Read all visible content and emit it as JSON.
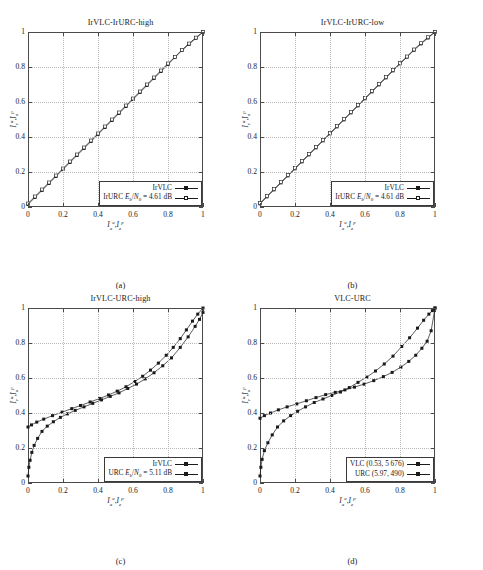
{
  "figure": {
    "axis_labels": {
      "x": "I_a^u , I_e^p",
      "y": "I_e^u , I_a^p"
    },
    "tick_labels": [
      "0",
      "0.2",
      "0.4",
      "0.6",
      "0.8",
      "1"
    ],
    "tick_values": [
      0,
      0.2,
      0.4,
      0.6,
      0.8,
      1
    ]
  },
  "panels": [
    {
      "id": "a",
      "caption": "(a)",
      "title": "IrVLC-IrURC-high",
      "legend": [
        {
          "label": "IrVLC",
          "marker": "filled-square"
        },
        {
          "label": "IrURC E_b/N_0 = 4.61 dB",
          "marker": "open-square"
        }
      ]
    },
    {
      "id": "b",
      "caption": "(b)",
      "title": "IrVLC-IrURC-low",
      "legend": [
        {
          "label": "IrVLC",
          "marker": "filled-square"
        },
        {
          "label": "IrURC E_b/N_0 = 4.61 dB",
          "marker": "open-square"
        }
      ]
    },
    {
      "id": "c",
      "caption": "(c)",
      "title": "IrVLC-URC-high",
      "legend": [
        {
          "label": "IrVLC",
          "marker": "filled-square"
        },
        {
          "label": "URC E_b/N_0 = 5.11 dB",
          "marker": "filled-square"
        }
      ]
    },
    {
      "id": "d",
      "caption": "(d)",
      "title": "VLC-URC",
      "legend": [
        {
          "label": "VLC (0.53, 5 676)",
          "marker": "filled-square"
        },
        {
          "label": "URC (5.97,   490)",
          "marker": "filled-square"
        }
      ]
    }
  ],
  "chart_data": [
    {
      "panel": "a",
      "type": "line",
      "title": "IrVLC-IrURC-high",
      "xlabel": "I_a^u , I_e^p",
      "ylabel": "I_e^u , I_a^p",
      "xlim": [
        0,
        1
      ],
      "ylim": [
        0,
        1
      ],
      "grid": true,
      "legend_position": "bottom-right",
      "series": [
        {
          "name": "IrVLC",
          "marker": "filled-square",
          "x": [
            0.0,
            0.04,
            0.08,
            0.12,
            0.16,
            0.2,
            0.24,
            0.28,
            0.32,
            0.36,
            0.4,
            0.44,
            0.48,
            0.52,
            0.56,
            0.6,
            0.64,
            0.68,
            0.72,
            0.76,
            0.8,
            0.84,
            0.88,
            0.92,
            0.96,
            1.0
          ],
          "y": [
            0.015,
            0.055,
            0.095,
            0.135,
            0.175,
            0.215,
            0.255,
            0.295,
            0.335,
            0.375,
            0.415,
            0.455,
            0.495,
            0.535,
            0.575,
            0.615,
            0.655,
            0.695,
            0.735,
            0.775,
            0.815,
            0.855,
            0.895,
            0.93,
            0.965,
            1.0
          ]
        },
        {
          "name": "IrURC Eb/N0 = 4.61 dB",
          "marker": "open-square",
          "x": [
            0.0,
            0.04,
            0.08,
            0.12,
            0.16,
            0.2,
            0.24,
            0.28,
            0.32,
            0.36,
            0.4,
            0.44,
            0.48,
            0.52,
            0.56,
            0.6,
            0.64,
            0.68,
            0.72,
            0.76,
            0.8,
            0.84,
            0.88,
            0.92,
            0.96,
            1.0
          ],
          "y": [
            0.02,
            0.06,
            0.1,
            0.14,
            0.18,
            0.22,
            0.26,
            0.3,
            0.34,
            0.38,
            0.42,
            0.46,
            0.5,
            0.54,
            0.58,
            0.62,
            0.66,
            0.7,
            0.74,
            0.78,
            0.82,
            0.858,
            0.898,
            0.934,
            0.968,
            1.0
          ]
        }
      ]
    },
    {
      "panel": "b",
      "type": "line",
      "title": "IrVLC-IrURC-low",
      "xlabel": "I_a^u , I_e^p",
      "ylabel": "I_e^u , I_a^p",
      "xlim": [
        0,
        1
      ],
      "ylim": [
        0,
        1
      ],
      "grid": true,
      "legend_position": "bottom-right",
      "series": [
        {
          "name": "IrVLC",
          "marker": "filled-square",
          "x": [
            0.0,
            0.04,
            0.08,
            0.12,
            0.16,
            0.2,
            0.24,
            0.28,
            0.32,
            0.36,
            0.4,
            0.44,
            0.48,
            0.52,
            0.56,
            0.6,
            0.64,
            0.68,
            0.72,
            0.76,
            0.8,
            0.84,
            0.88,
            0.92,
            0.96,
            1.0
          ],
          "y": [
            0.018,
            0.058,
            0.098,
            0.138,
            0.178,
            0.218,
            0.258,
            0.298,
            0.338,
            0.378,
            0.418,
            0.458,
            0.498,
            0.538,
            0.578,
            0.618,
            0.658,
            0.698,
            0.738,
            0.778,
            0.818,
            0.857,
            0.896,
            0.932,
            0.966,
            1.0
          ]
        },
        {
          "name": "IrURC Eb/N0 = 4.61 dB",
          "marker": "open-square",
          "x": [
            0.0,
            0.04,
            0.08,
            0.12,
            0.16,
            0.2,
            0.24,
            0.28,
            0.32,
            0.36,
            0.4,
            0.44,
            0.48,
            0.52,
            0.56,
            0.6,
            0.64,
            0.68,
            0.72,
            0.76,
            0.8,
            0.84,
            0.88,
            0.92,
            0.96,
            1.0
          ],
          "y": [
            0.022,
            0.062,
            0.102,
            0.142,
            0.182,
            0.222,
            0.262,
            0.302,
            0.342,
            0.382,
            0.422,
            0.462,
            0.502,
            0.542,
            0.582,
            0.622,
            0.662,
            0.702,
            0.742,
            0.782,
            0.822,
            0.86,
            0.9,
            0.936,
            0.97,
            1.0
          ]
        }
      ]
    },
    {
      "panel": "c",
      "type": "line",
      "title": "IrVLC-URC-high",
      "xlabel": "I_a^u , I_e^p",
      "ylabel": "I_e^u , I_a^p",
      "xlim": [
        0,
        1
      ],
      "ylim": [
        0,
        1
      ],
      "grid": true,
      "legend_position": "bottom-right",
      "series": [
        {
          "name": "IrVLC",
          "marker": "filled-square",
          "x": [
            0.0,
            0.005,
            0.012,
            0.022,
            0.035,
            0.055,
            0.08,
            0.11,
            0.145,
            0.185,
            0.225,
            0.27,
            0.32,
            0.37,
            0.42,
            0.47,
            0.52,
            0.57,
            0.62,
            0.67,
            0.72,
            0.77,
            0.82,
            0.87,
            0.915,
            0.955,
            0.98,
            1.0
          ],
          "y": [
            0.04,
            0.09,
            0.13,
            0.175,
            0.215,
            0.255,
            0.295,
            0.325,
            0.35,
            0.375,
            0.395,
            0.415,
            0.435,
            0.455,
            0.475,
            0.495,
            0.515,
            0.54,
            0.565,
            0.595,
            0.63,
            0.67,
            0.715,
            0.775,
            0.835,
            0.895,
            0.935,
            0.975
          ]
        },
        {
          "name": "URC Eb/N0 = 5.11 dB",
          "marker": "filled-square",
          "x": [
            0.0,
            0.02,
            0.05,
            0.09,
            0.14,
            0.195,
            0.25,
            0.3,
            0.355,
            0.41,
            0.46,
            0.51,
            0.56,
            0.61,
            0.655,
            0.7,
            0.745,
            0.79,
            0.83,
            0.87,
            0.905,
            0.94,
            0.97,
            1.0
          ],
          "y": [
            0.32,
            0.332,
            0.348,
            0.365,
            0.385,
            0.405,
            0.425,
            0.443,
            0.463,
            0.483,
            0.503,
            0.525,
            0.55,
            0.58,
            0.61,
            0.645,
            0.685,
            0.73,
            0.775,
            0.825,
            0.875,
            0.925,
            0.965,
            1.0
          ]
        }
      ]
    },
    {
      "panel": "d",
      "type": "line",
      "title": "VLC-URC",
      "xlabel": "I_a^u , I_e^p",
      "ylabel": "I_e^u , I_a^p",
      "xlim": [
        0,
        1
      ],
      "ylim": [
        0,
        1
      ],
      "grid": true,
      "legend_position": "bottom-right",
      "series": [
        {
          "name": "VLC (0.53, 5676)",
          "marker": "filled-square",
          "x": [
            0.0,
            0.005,
            0.012,
            0.025,
            0.045,
            0.07,
            0.1,
            0.135,
            0.175,
            0.215,
            0.26,
            0.31,
            0.36,
            0.41,
            0.46,
            0.51,
            0.56,
            0.61,
            0.66,
            0.71,
            0.76,
            0.81,
            0.855,
            0.9,
            0.935,
            0.965,
            0.985,
            1.0
          ],
          "y": [
            0.04,
            0.09,
            0.135,
            0.185,
            0.23,
            0.275,
            0.32,
            0.355,
            0.385,
            0.41,
            0.435,
            0.46,
            0.48,
            0.5,
            0.52,
            0.545,
            0.575,
            0.605,
            0.64,
            0.68,
            0.725,
            0.78,
            0.83,
            0.885,
            0.93,
            0.965,
            0.985,
            1.0
          ]
        },
        {
          "name": "URC (5.97, 490)",
          "marker": "filled-square",
          "x": [
            0.0,
            0.025,
            0.06,
            0.105,
            0.155,
            0.21,
            0.265,
            0.32,
            0.375,
            0.43,
            0.485,
            0.54,
            0.595,
            0.65,
            0.705,
            0.755,
            0.805,
            0.85,
            0.89,
            0.925,
            0.955,
            0.978,
            1.0
          ],
          "y": [
            0.37,
            0.385,
            0.4,
            0.418,
            0.435,
            0.452,
            0.47,
            0.488,
            0.505,
            0.518,
            0.532,
            0.548,
            0.565,
            0.585,
            0.608,
            0.632,
            0.662,
            0.695,
            0.73,
            0.77,
            0.81,
            0.87,
            1.0
          ]
        }
      ]
    }
  ]
}
